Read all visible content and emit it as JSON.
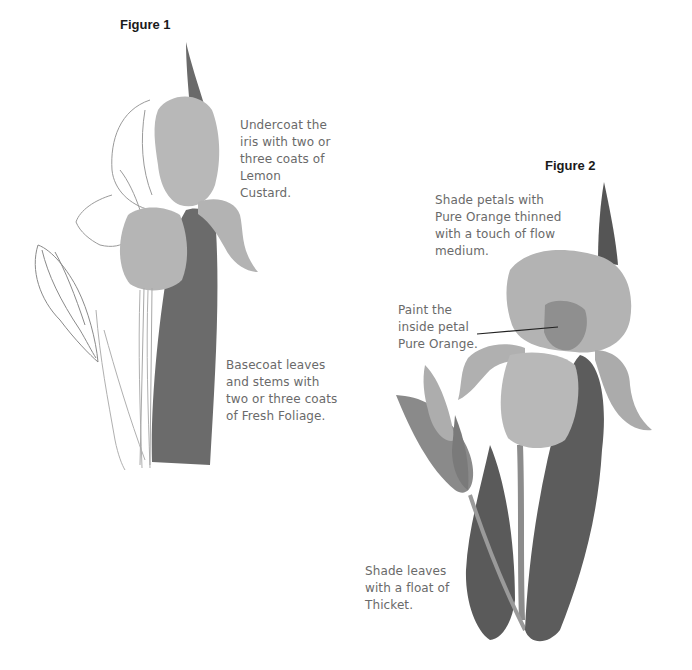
{
  "figure1": {
    "title": "Figure 1",
    "note_top": "Undercoat the\niris with two or\nthree coats of\nLemon\nCustard.",
    "note_bottom": "Basecoat leaves\nand stems with\ntwo or three coats\nof Fresh Foliage."
  },
  "figure2": {
    "title": "Figure 2",
    "note_top": "Shade petals with\nPure Orange thinned\nwith a touch of flow\nmedium.",
    "note_middle": "Paint the\ninside petal\nPure Orange.",
    "note_bottom": "Shade leaves\nwith a float of\nThicket."
  },
  "colors": {
    "petal": "#b5b5b5",
    "leaf_dark": "#5e5e5e",
    "leaf_mid": "#7d7d7d",
    "sketch": "#8a8a8a",
    "text": "#6a6a6a"
  }
}
